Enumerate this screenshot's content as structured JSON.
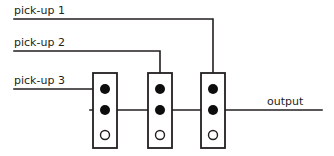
{
  "diagram": {
    "labels": {
      "pickup1": "pick-up 1",
      "pickup2": "pick-up 2",
      "pickup3": "pick-up 3",
      "output": "output"
    },
    "colors": {
      "wire": "#231f20",
      "lug_filled": "#0d0d0d",
      "lug_hollow_fill": "#ffffff",
      "background": "#ffffff"
    },
    "components": [
      {
        "name": "potentiometer-1",
        "lugs": [
          "filled",
          "filled",
          "hollow"
        ]
      },
      {
        "name": "potentiometer-2",
        "lugs": [
          "filled",
          "filled",
          "hollow"
        ]
      },
      {
        "name": "potentiometer-3",
        "lugs": [
          "filled",
          "filled",
          "hollow"
        ]
      }
    ],
    "connections": [
      {
        "from": "pick-up 1",
        "to": "potentiometer-3 top lug"
      },
      {
        "from": "pick-up 2",
        "to": "potentiometer-2 top lug"
      },
      {
        "from": "pick-up 3",
        "to": "potentiometer-1 top lug"
      },
      {
        "from": "potentiometer middle lugs",
        "to": "output"
      }
    ]
  }
}
